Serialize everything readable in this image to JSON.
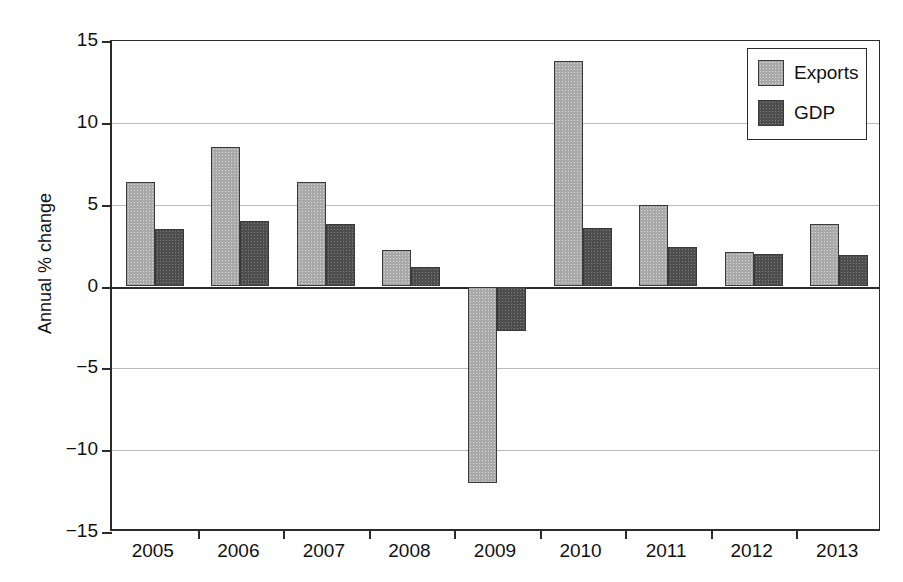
{
  "chart_data": {
    "type": "bar",
    "title": "",
    "xlabel": "",
    "ylabel": "Annual % change",
    "ylim": [
      -15,
      15
    ],
    "yticks": [
      "15",
      "10",
      "5",
      "0",
      "−5",
      "−10",
      "−15"
    ],
    "ytick_values": [
      15,
      10,
      5,
      0,
      -5,
      -10,
      -15
    ],
    "grid": true,
    "legend_position": "top-right",
    "categories": [
      "2005",
      "2006",
      "2007",
      "2008",
      "2009",
      "2010",
      "2011",
      "2012",
      "2013"
    ],
    "series": [
      {
        "name": "Exports",
        "color": "#a9a9a9",
        "values": [
          6.4,
          8.5,
          6.4,
          2.2,
          -12.0,
          13.8,
          5.0,
          2.1,
          3.8
        ]
      },
      {
        "name": "GDP",
        "color": "#4d4d4d",
        "values": [
          3.5,
          4.0,
          3.8,
          1.2,
          -2.7,
          3.6,
          2.4,
          2.0,
          1.9
        ]
      }
    ]
  },
  "legend": {
    "items": [
      {
        "label": "Exports"
      },
      {
        "label": "GDP"
      }
    ]
  },
  "axes": {
    "y_title": "Annual % change"
  },
  "title_fragment": ""
}
